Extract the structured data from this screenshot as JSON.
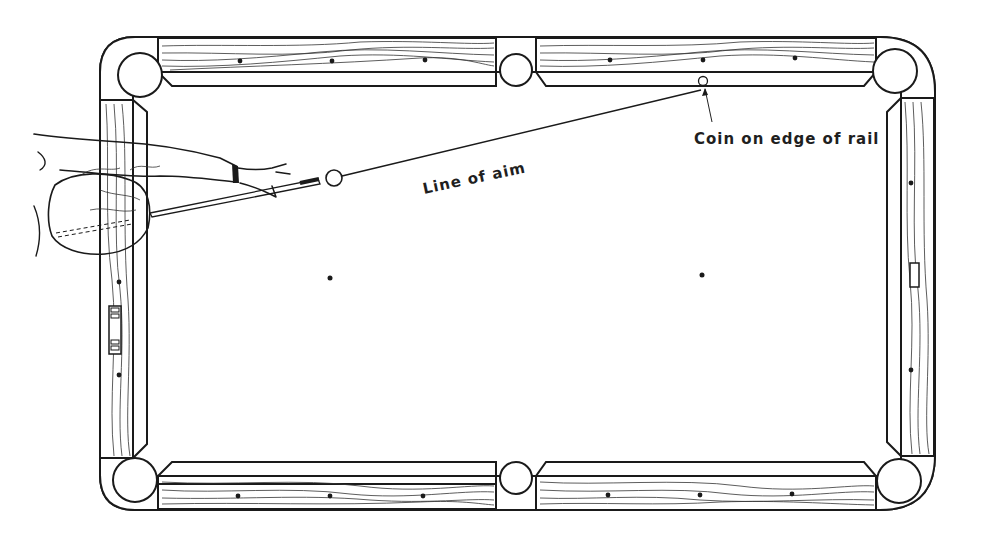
{
  "figure": {
    "type": "pool-table-illustration",
    "labels": {
      "line_of_aim": "Line of aim",
      "coin": "Coin on edge of rail"
    },
    "elements": {
      "pockets": [
        "top-left corner",
        "top side",
        "top-right corner",
        "bottom-left corner",
        "bottom side",
        "bottom-right corner"
      ],
      "cue_ball": "cue ball near head rail",
      "coin": "coin on top rail cushion edge",
      "spots": [
        "head spot",
        "foot spot"
      ]
    },
    "colors": {
      "line": "#1a1a1a",
      "background": "#ffffff"
    }
  }
}
